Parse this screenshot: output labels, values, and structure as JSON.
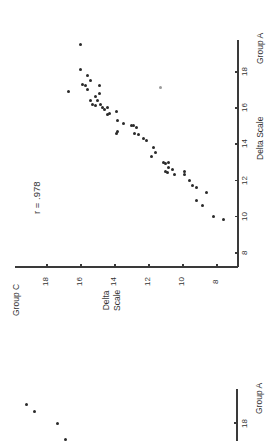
{
  "chart_data": [
    {
      "type": "scatter",
      "orientation_note": "figure printed rotated 90 degrees counter-clockwise",
      "title": "",
      "annotation": "r = .978",
      "xlabel": "Delta Scale",
      "xlabel_secondary": "Group A",
      "ylabel": "Delta Scale",
      "ylabel_secondary": "Group C",
      "xlim": [
        7,
        19.5
      ],
      "ylim": [
        7,
        19
      ],
      "xticks": [
        "8",
        "10",
        "12",
        "14",
        "16",
        "18"
      ],
      "yticks": [
        "8",
        "10",
        "12",
        "14",
        "16",
        "18"
      ],
      "grid": false,
      "legend": null,
      "points": [
        {
          "x": 19.5,
          "y": 16.0
        },
        {
          "x": 18.1,
          "y": 16.0
        },
        {
          "x": 17.8,
          "y": 15.6
        },
        {
          "x": 17.3,
          "y": 15.9
        },
        {
          "x": 17.2,
          "y": 15.7
        },
        {
          "x": 16.9,
          "y": 16.7
        },
        {
          "x": 17.5,
          "y": 15.4
        },
        {
          "x": 17.2,
          "y": 14.9
        },
        {
          "x": 17.0,
          "y": 15.6
        },
        {
          "x": 16.8,
          "y": 14.9
        },
        {
          "x": 16.6,
          "y": 15.1
        },
        {
          "x": 16.4,
          "y": 15.4
        },
        {
          "x": 16.4,
          "y": 15.0
        },
        {
          "x": 16.2,
          "y": 15.3
        },
        {
          "x": 16.1,
          "y": 15.1
        },
        {
          "x": 16.2,
          "y": 14.8
        },
        {
          "x": 16.0,
          "y": 14.7
        },
        {
          "x": 15.9,
          "y": 14.6
        },
        {
          "x": 16.0,
          "y": 14.4
        },
        {
          "x": 15.7,
          "y": 14.3
        },
        {
          "x": 15.8,
          "y": 13.9
        },
        {
          "x": 15.6,
          "y": 14.4
        },
        {
          "x": 15.3,
          "y": 13.8
        },
        {
          "x": 15.1,
          "y": 13.5
        },
        {
          "x": 15.0,
          "y": 13.0
        },
        {
          "x": 14.7,
          "y": 13.8
        },
        {
          "x": 14.6,
          "y": 13.9
        },
        {
          "x": 14.9,
          "y": 12.7
        },
        {
          "x": 15.0,
          "y": 12.9
        },
        {
          "x": 14.6,
          "y": 12.8
        },
        {
          "x": 14.5,
          "y": 12.6
        },
        {
          "x": 14.3,
          "y": 12.3
        },
        {
          "x": 14.2,
          "y": 12.1
        },
        {
          "x": 13.8,
          "y": 11.7
        },
        {
          "x": 13.5,
          "y": 11.6
        },
        {
          "x": 13.3,
          "y": 11.8
        },
        {
          "x": 13.0,
          "y": 11.1
        },
        {
          "x": 12.9,
          "y": 11.0
        },
        {
          "x": 13.0,
          "y": 10.8
        },
        {
          "x": 12.7,
          "y": 10.8
        },
        {
          "x": 12.6,
          "y": 10.6
        },
        {
          "x": 12.5,
          "y": 11.0
        },
        {
          "x": 12.4,
          "y": 10.9
        },
        {
          "x": 12.3,
          "y": 10.5
        },
        {
          "x": 12.5,
          "y": 9.9
        },
        {
          "x": 12.3,
          "y": 9.9
        },
        {
          "x": 12.0,
          "y": 9.6
        },
        {
          "x": 11.7,
          "y": 9.4
        },
        {
          "x": 11.6,
          "y": 9.2
        },
        {
          "x": 11.3,
          "y": 8.6
        },
        {
          "x": 10.9,
          "y": 9.2
        },
        {
          "x": 10.6,
          "y": 8.8
        },
        {
          "x": 10.0,
          "y": 8.2
        },
        {
          "x": 9.8,
          "y": 7.6
        },
        {
          "x": 17.1,
          "y": 11.3
        }
      ]
    },
    {
      "type": "scatter",
      "note": "partially visible second figure at bottom of page",
      "xlabel_secondary": "Group A",
      "xticks": [
        "18"
      ],
      "points_visible": 4
    }
  ],
  "labels": {
    "r_value": "r = .978",
    "group_a": "Group A",
    "group_c": "Group C",
    "delta_scale_x": "Delta Scale",
    "delta_scale_y": "Delta\nScale",
    "ticks": [
      "8",
      "10",
      "12",
      "14",
      "16",
      "18"
    ],
    "lower_group_a": "Group A",
    "lower_tick": "18"
  },
  "lower_points_px": [
    [
      26,
      404
    ],
    [
      34,
      411
    ],
    [
      57,
      423
    ],
    [
      65,
      439
    ]
  ],
  "colors": {
    "axis": "#3a3a3a",
    "point": "#2a2a2a",
    "text": "#333333"
  }
}
